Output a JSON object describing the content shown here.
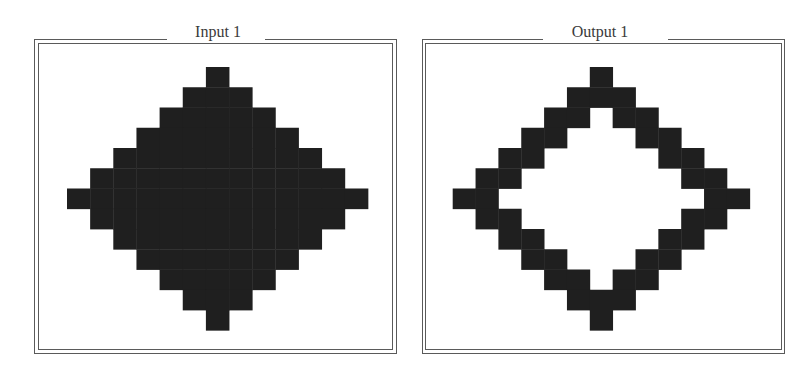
{
  "panels": [
    {
      "id": "input",
      "title": "Input 1",
      "frame": {
        "outer": [
          34,
          39,
          363,
          315
        ],
        "inner": [
          38,
          43,
          355,
          307
        ]
      },
      "title_gap": [
        167,
        98
      ],
      "title_center_x": 218,
      "grid": {
        "rows": 13,
        "cols": 13,
        "origin": [
          67,
          67
        ],
        "cell": [
          23.15,
          20.25
        ],
        "fill": "#1f1f1f",
        "cells": [
          "0000001000000",
          "0000011100000",
          "0000111110000",
          "0001111111000",
          "0011111111100",
          "0111111111110",
          "1111111111111",
          "0111111111110",
          "0011111111100",
          "0001111111000",
          "0000111110000",
          "0000011100000",
          "0000001000000"
        ]
      }
    },
    {
      "id": "output",
      "title": "Output 1",
      "frame": {
        "outer": [
          422,
          39,
          363,
          315
        ],
        "inner": [
          425,
          43,
          357,
          307
        ]
      },
      "title_gap": [
        543,
        125
      ],
      "title_center_x": 600,
      "grid": {
        "rows": 13,
        "cols": 13,
        "origin": [
          452.7,
          67
        ],
        "cell": [
          22.85,
          20.25
        ],
        "fill": "#1f1f1f",
        "cells": [
          "0000001000000",
          "0000011100000",
          "0000110110000",
          "0001100011000",
          "0011000001100",
          "0110000000110",
          "1100000000011",
          "0110000000110",
          "0011000001100",
          "0001100011000",
          "0000110110000",
          "0000011100000",
          "0000001000000"
        ]
      }
    }
  ],
  "colors": {
    "frame": "#5a5a5a",
    "cell_filled": "#1f1f1f",
    "background": "#ffffff",
    "title_text": "#3a3a3a"
  }
}
